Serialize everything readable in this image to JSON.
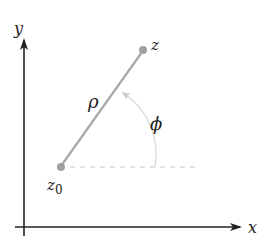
{
  "diagram": {
    "axes": {
      "x_label": "x",
      "y_label": "y"
    },
    "points": {
      "start_label": "z",
      "start_subscript": "0",
      "end_label": "z"
    },
    "segment_label": "ρ",
    "angle_label": "ϕ",
    "colors": {
      "axis": "#222222",
      "segment": "#a8a8a8",
      "point": "#a0a0a0",
      "dashed": "#c8c8c8",
      "arc": "#d4d4d4"
    }
  }
}
